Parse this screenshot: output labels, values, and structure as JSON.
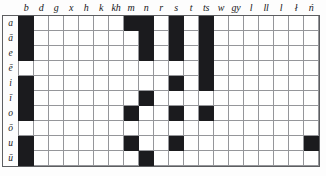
{
  "figure": {
    "type": "phoneme-cooccurrence-matrix",
    "orientation": "consonants-as-columns-vowels-as-rows"
  },
  "columns": [
    {
      "id": "b",
      "label": "b"
    },
    {
      "id": "d",
      "label": "d"
    },
    {
      "id": "g",
      "label": "g"
    },
    {
      "id": "x",
      "label": "x"
    },
    {
      "id": "h",
      "label": "h"
    },
    {
      "id": "k",
      "label": "k"
    },
    {
      "id": "kh",
      "label": "kh"
    },
    {
      "id": "m",
      "label": "m"
    },
    {
      "id": "n",
      "label": "n"
    },
    {
      "id": "r",
      "label": "r"
    },
    {
      "id": "s",
      "label": "s"
    },
    {
      "id": "t",
      "label": "t"
    },
    {
      "id": "ts",
      "label": "ts"
    },
    {
      "id": "w",
      "label": "w"
    },
    {
      "id": "gy",
      "label": "gy"
    },
    {
      "id": "l",
      "label": "l"
    },
    {
      "id": "ll",
      "label": "ll"
    },
    {
      "id": "l2",
      "label": "l"
    },
    {
      "id": "lb",
      "label": "ł"
    },
    {
      "id": "nn",
      "label": "ń"
    }
  ],
  "rows": [
    {
      "id": "a",
      "label": "a"
    },
    {
      "id": "aa",
      "label": "ā"
    },
    {
      "id": "e",
      "label": "e"
    },
    {
      "id": "ee",
      "label": "ē"
    },
    {
      "id": "i",
      "label": "i"
    },
    {
      "id": "ii",
      "label": "ī"
    },
    {
      "id": "o",
      "label": "o"
    },
    {
      "id": "oo",
      "label": "ō"
    },
    {
      "id": "u",
      "label": "u"
    },
    {
      "id": "uu",
      "label": "ū"
    }
  ],
  "chart_data": {
    "type": "heatmap",
    "title": "",
    "xlabel": "",
    "ylabel": "",
    "grid": true,
    "legend": "none",
    "categories": [
      "b",
      "d",
      "g",
      "x",
      "h",
      "k",
      "kh",
      "m",
      "n",
      "r",
      "s",
      "t",
      "ts",
      "w",
      "gy",
      "l",
      "ll",
      "l",
      "ł",
      "ń"
    ],
    "row_categories": [
      "a",
      "ā",
      "e",
      "ē",
      "i",
      "ī",
      "o",
      "ō",
      "u",
      "ū"
    ],
    "value_meaning": {
      "1": "attested / filled (black)",
      "0": "not attested (white)"
    },
    "colors": {
      "filled": "#1b1b1e",
      "empty": "#ffffff",
      "gridline": "#95969a"
    },
    "matrix": [
      [
        1,
        0,
        0,
        0,
        0,
        0,
        0,
        1,
        1,
        0,
        1,
        0,
        1,
        0,
        0,
        0,
        0,
        0,
        0,
        0
      ],
      [
        1,
        0,
        0,
        0,
        0,
        0,
        0,
        0,
        1,
        0,
        1,
        0,
        1,
        0,
        0,
        0,
        0,
        0,
        0,
        0
      ],
      [
        1,
        0,
        0,
        0,
        0,
        0,
        0,
        0,
        1,
        0,
        1,
        0,
        1,
        0,
        0,
        0,
        0,
        0,
        0,
        0
      ],
      [
        0,
        0,
        0,
        0,
        0,
        0,
        0,
        0,
        0,
        0,
        0,
        0,
        1,
        0,
        0,
        0,
        0,
        0,
        0,
        0
      ],
      [
        1,
        0,
        0,
        0,
        0,
        0,
        0,
        0,
        0,
        0,
        1,
        0,
        1,
        0,
        0,
        0,
        0,
        0,
        0,
        0
      ],
      [
        1,
        0,
        0,
        0,
        0,
        0,
        0,
        0,
        1,
        0,
        0,
        0,
        0,
        0,
        0,
        0,
        0,
        0,
        0,
        0
      ],
      [
        1,
        0,
        0,
        0,
        0,
        0,
        0,
        1,
        0,
        0,
        1,
        0,
        1,
        0,
        0,
        0,
        0,
        0,
        0,
        0
      ],
      [
        0,
        0,
        0,
        0,
        0,
        0,
        0,
        0,
        0,
        0,
        0,
        0,
        0,
        0,
        0,
        0,
        0,
        0,
        0,
        0
      ],
      [
        1,
        0,
        0,
        0,
        0,
        0,
        0,
        1,
        0,
        0,
        1,
        0,
        0,
        0,
        0,
        0,
        0,
        0,
        0,
        1
      ],
      [
        1,
        0,
        0,
        0,
        0,
        0,
        0,
        0,
        1,
        0,
        0,
        0,
        0,
        0,
        0,
        0,
        0,
        0,
        0,
        0
      ]
    ]
  }
}
